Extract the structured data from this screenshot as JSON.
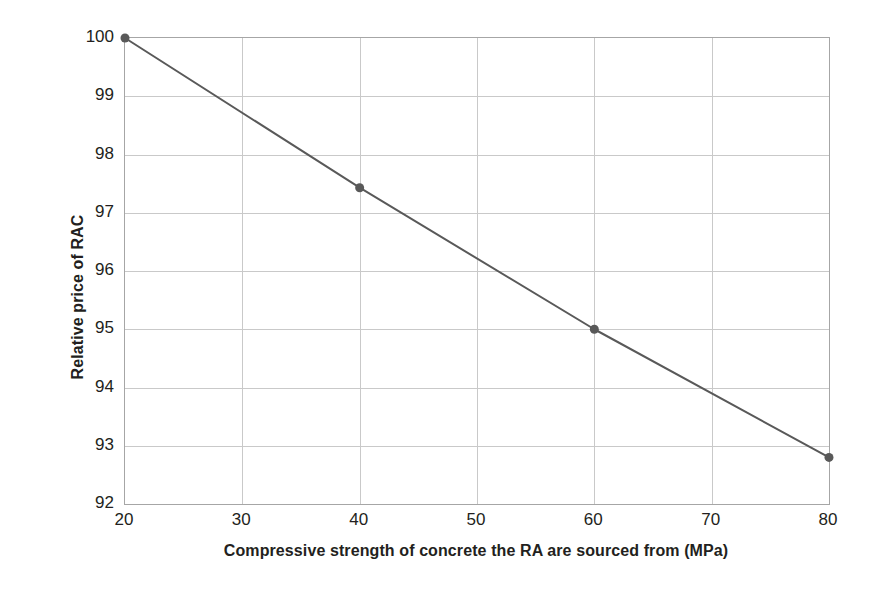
{
  "chart_data": {
    "type": "line",
    "title": "",
    "subtitle": "",
    "xlabel": "Compressive strength of concrete the RA are sourced from (MPa)",
    "ylabel": "Relative price of RAC",
    "xlim": [
      20,
      80
    ],
    "ylim": [
      92,
      100
    ],
    "xticks": [
      20,
      30,
      40,
      50,
      60,
      70,
      80
    ],
    "yticks": [
      92,
      93,
      94,
      95,
      96,
      97,
      98,
      99,
      100
    ],
    "xtick_labels": [
      "20",
      "30",
      "40",
      "50",
      "60",
      "70",
      "80"
    ],
    "ytick_labels": [
      "92",
      "93",
      "94",
      "95",
      "96",
      "97",
      "98",
      "99",
      "100"
    ],
    "grid": true,
    "grid_axes": "both",
    "legend": false,
    "legend_position": "none",
    "x": [
      20,
      40,
      60,
      80
    ],
    "series": [
      {
        "name": "Relative price of RAC",
        "values": [
          100,
          97.43,
          95.0,
          92.8
        ],
        "line_color": "#595959",
        "marker_color": "#595959",
        "marker": "circle",
        "marker_size": 9,
        "line_width": 2
      }
    ],
    "annotations": [],
    "colors": {
      "background": "#ffffff",
      "grid": "#c9c9c9",
      "axis": "#a6a6a6",
      "text": "#231f20",
      "series": "#595959"
    }
  }
}
